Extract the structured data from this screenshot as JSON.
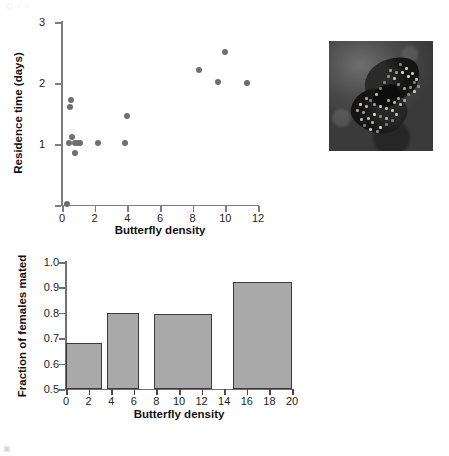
{
  "watermark": {
    "top_left": "© ▫ ▫",
    "bottom_left": "▣"
  },
  "figure": {
    "photo_caption": "butterfly-photograph"
  },
  "chart_data": [
    {
      "id": "scatter",
      "type": "scatter",
      "title": "",
      "xlabel": "Butterfly density",
      "ylabel": "Residence time (days)",
      "xlim": [
        0,
        12
      ],
      "ylim": [
        0,
        3
      ],
      "xticks": [
        0,
        2,
        4,
        6,
        8,
        10,
        12
      ],
      "yticks": [
        0,
        1,
        2,
        3
      ],
      "xticklabels": [
        "0",
        "2",
        "4",
        "6",
        "8",
        "10",
        "12"
      ],
      "yticklabels": [
        "",
        "1",
        "2",
        "3"
      ],
      "grid": false,
      "legend": null,
      "marker_color": "#6e6e6e",
      "points": [
        {
          "x": 0.3,
          "y": 0.02
        },
        {
          "x": 0.55,
          "y": 1.72
        },
        {
          "x": 0.48,
          "y": 1.6
        },
        {
          "x": 0.62,
          "y": 1.12
        },
        {
          "x": 0.45,
          "y": 1.02
        },
        {
          "x": 0.82,
          "y": 1.02
        },
        {
          "x": 1.0,
          "y": 1.02
        },
        {
          "x": 1.1,
          "y": 1.02
        },
        {
          "x": 0.8,
          "y": 0.85
        },
        {
          "x": 2.2,
          "y": 1.02
        },
        {
          "x": 3.85,
          "y": 1.02
        },
        {
          "x": 4.0,
          "y": 1.46
        },
        {
          "x": 8.4,
          "y": 2.21
        },
        {
          "x": 9.55,
          "y": 2.02
        },
        {
          "x": 9.95,
          "y": 2.51
        },
        {
          "x": 11.35,
          "y": 2.0
        }
      ]
    },
    {
      "id": "bar",
      "type": "bar",
      "title": "",
      "xlabel": "Butterfly density",
      "ylabel": "Fraction of females mated",
      "xlim": [
        0,
        20
      ],
      "ylim": [
        0.5,
        1.0
      ],
      "xticks": [
        0,
        2,
        4,
        6,
        8,
        10,
        12,
        14,
        16,
        18,
        20
      ],
      "yticks": [
        0.5,
        0.6,
        0.7,
        0.8,
        0.9,
        1.0
      ],
      "xticklabels": [
        "0",
        "2",
        "4",
        "6",
        "8",
        "10",
        "12",
        "14",
        "16",
        "18",
        "20"
      ],
      "yticklabels": [
        "0.5",
        "0.6",
        "0.7",
        "0.8",
        "0.9",
        "1.0"
      ],
      "grid": false,
      "legend": null,
      "bar_fill": "#a9a9a9",
      "bar_edge": "#3b3b3b",
      "bars": [
        {
          "x_start": 0.0,
          "x_end": 3.2,
          "value": 0.68
        },
        {
          "x_start": 3.6,
          "x_end": 6.5,
          "value": 0.8
        },
        {
          "x_start": 7.8,
          "x_end": 12.9,
          "value": 0.795
        },
        {
          "x_start": 14.8,
          "x_end": 20.0,
          "value": 0.92
        }
      ]
    }
  ]
}
